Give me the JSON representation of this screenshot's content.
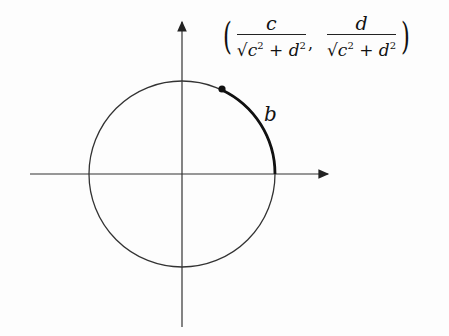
{
  "diagram": {
    "type": "unit-circle",
    "axes": {
      "origin": [
        182,
        174
      ],
      "x_axis": [
        30,
        330
      ],
      "y_axis": [
        20,
        327
      ]
    },
    "circle": {
      "center": [
        182,
        174
      ],
      "radius": 94
    },
    "point": {
      "position": [
        222,
        89
      ]
    },
    "arc_label": "b",
    "coordinate_label": {
      "x_numerator": "c",
      "y_numerator": "d",
      "denominator_radical": "√",
      "denominator_term1": "c",
      "denominator_op": "+",
      "denominator_term2": "d",
      "exponent": "2",
      "open_paren": "(",
      "close_paren": ")",
      "separator": ","
    }
  }
}
